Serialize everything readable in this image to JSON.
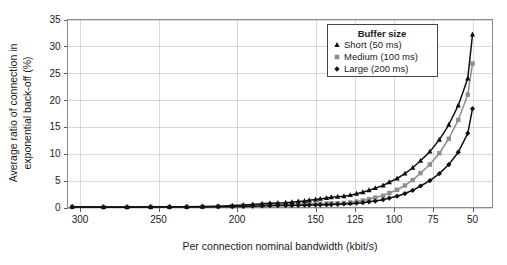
{
  "chart_data": {
    "type": "line",
    "title": "",
    "xlabel": "Per connection nominal bandwidth (kbit/s)",
    "ylabel": "Average ratio of connection in exponential back-off (%)",
    "ylabel_line1": "Average ratio of connection in",
    "ylabel_line2": "exponential back-off (%)",
    "x_tick_labels": [
      "300",
      "250",
      "200",
      "150",
      "125",
      "100",
      "75",
      "50"
    ],
    "x_tick_values": [
      300,
      250,
      200,
      150,
      125,
      100,
      75,
      50
    ],
    "y_tick_labels": [
      "0",
      "5",
      "10",
      "15",
      "20",
      "25",
      "30",
      "35"
    ],
    "y_tick_values": [
      0,
      5,
      10,
      15,
      20,
      25,
      30,
      35
    ],
    "ylim": [
      0,
      35
    ],
    "x_axis_reversed": true,
    "grid": true,
    "legend_position": "top-right",
    "legend_title": "Buffer size",
    "x": [
      305,
      285,
      270,
      255,
      243,
      232,
      222,
      212,
      203,
      196,
      190,
      184,
      179,
      174,
      169,
      165,
      161,
      157,
      154,
      150,
      147,
      143,
      140,
      136,
      132,
      128,
      124,
      120,
      116,
      112,
      107,
      103,
      98,
      93,
      88,
      83,
      77,
      71,
      65,
      59,
      53,
      50
    ],
    "series": [
      {
        "name": "Short (50 ms)",
        "label": "Short (50 ms)",
        "marker": "triangle",
        "color": "#111111",
        "values": [
          0.15,
          0.1,
          0.1,
          0.12,
          0.12,
          0.15,
          0.2,
          0.25,
          0.35,
          0.45,
          0.55,
          0.7,
          0.8,
          0.85,
          0.9,
          1.0,
          1.1,
          1.2,
          1.35,
          1.5,
          1.6,
          1.75,
          1.9,
          2.0,
          2.1,
          2.3,
          2.55,
          2.85,
          3.2,
          3.6,
          4.1,
          4.7,
          5.4,
          6.3,
          7.4,
          8.7,
          10.4,
          12.6,
          15.4,
          19.0,
          24.0,
          32.2
        ]
      },
      {
        "name": "Medium (100 ms)",
        "label": "Medium (100 ms)",
        "marker": "square",
        "color": "#8e8e8e",
        "values": [
          0.12,
          0.08,
          0.08,
          0.1,
          0.1,
          0.12,
          0.15,
          0.2,
          0.25,
          0.3,
          0.4,
          0.5,
          0.55,
          0.6,
          0.6,
          0.6,
          0.62,
          0.65,
          0.68,
          0.7,
          0.72,
          0.75,
          0.78,
          0.8,
          0.85,
          0.95,
          1.1,
          1.3,
          1.55,
          1.85,
          2.2,
          2.7,
          3.3,
          4.1,
          5.1,
          6.4,
          8.0,
          10.1,
          12.8,
          16.3,
          21.0,
          26.8
        ]
      },
      {
        "name": "Large (200 ms)",
        "label": "Large (200 ms)",
        "marker": "diamond",
        "color": "#111111",
        "values": [
          0.1,
          0.05,
          0.05,
          0.07,
          0.07,
          0.08,
          0.1,
          0.12,
          0.15,
          0.2,
          0.25,
          0.3,
          0.33,
          0.35,
          0.37,
          0.38,
          0.4,
          0.42,
          0.45,
          0.47,
          0.5,
          0.52,
          0.55,
          0.6,
          0.65,
          0.7,
          0.8,
          0.9,
          1.05,
          1.2,
          1.45,
          1.75,
          2.1,
          2.6,
          3.2,
          4.0,
          5.0,
          6.3,
          8.0,
          10.3,
          13.8,
          18.4
        ]
      }
    ]
  },
  "axes": {
    "x_title": "Per connection nominal bandwidth (kbit/s)",
    "y_title_line1": "Average ratio of connection in",
    "y_title_line2": "exponential back-off (%)"
  },
  "legend": {
    "title": "Buffer size",
    "entries": [
      {
        "label": "Short (50 ms)",
        "marker": "triangle-up-icon",
        "color": "#111111"
      },
      {
        "label": "Medium (100 ms)",
        "marker": "square-icon",
        "color": "#8e8e8e"
      },
      {
        "label": "Large (200 ms)",
        "marker": "diamond-icon",
        "color": "#111111"
      }
    ]
  },
  "ticks": {
    "x": [
      "300",
      "250",
      "200",
      "150",
      "125",
      "100",
      "75",
      "50"
    ],
    "y": [
      "0",
      "5",
      "10",
      "15",
      "20",
      "25",
      "30",
      "35"
    ]
  }
}
